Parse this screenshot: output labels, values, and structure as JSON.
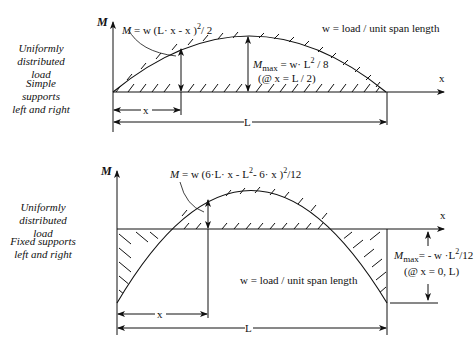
{
  "top_panel": {
    "side_label_load": [
      "Uniformly",
      "distributed load"
    ],
    "side_label_support": [
      "Simple supports",
      "left and right"
    ],
    "axis_y_label": "M",
    "axis_x_label": "x",
    "moment_equation": "M = w (L·x - x )²/ 2",
    "max_moment_equation": "Mmax = w· L² / 8",
    "max_moment_symbol": "M",
    "max_moment_subscript": "max",
    "max_moment_rhs": "= w· L",
    "max_moment_rhs_tail": " / 8",
    "max_location": "(@ x = L / 2)",
    "load_definition": "w = load / unit span length",
    "dim_x": "x",
    "dim_L": "L"
  },
  "bottom_panel": {
    "side_label_load": [
      "Uniformly",
      "distributed load"
    ],
    "side_label_support": [
      "Fixed supports",
      "left and right"
    ],
    "axis_y_label": "M",
    "axis_x_label": "x",
    "moment_equation": "M = w (6·L·x - L²- 6·x )²/12",
    "max_moment_equation": "Mmax = - w·L²/12",
    "max_moment_symbol": "M",
    "max_moment_subscript": "max",
    "max_moment_rhs": "= - w ·L",
    "max_moment_rhs_tail": "/12",
    "max_location": "(@ x = 0, L)",
    "load_definition": "w = load / unit span length",
    "dim_x": "x",
    "dim_L": "L"
  }
}
